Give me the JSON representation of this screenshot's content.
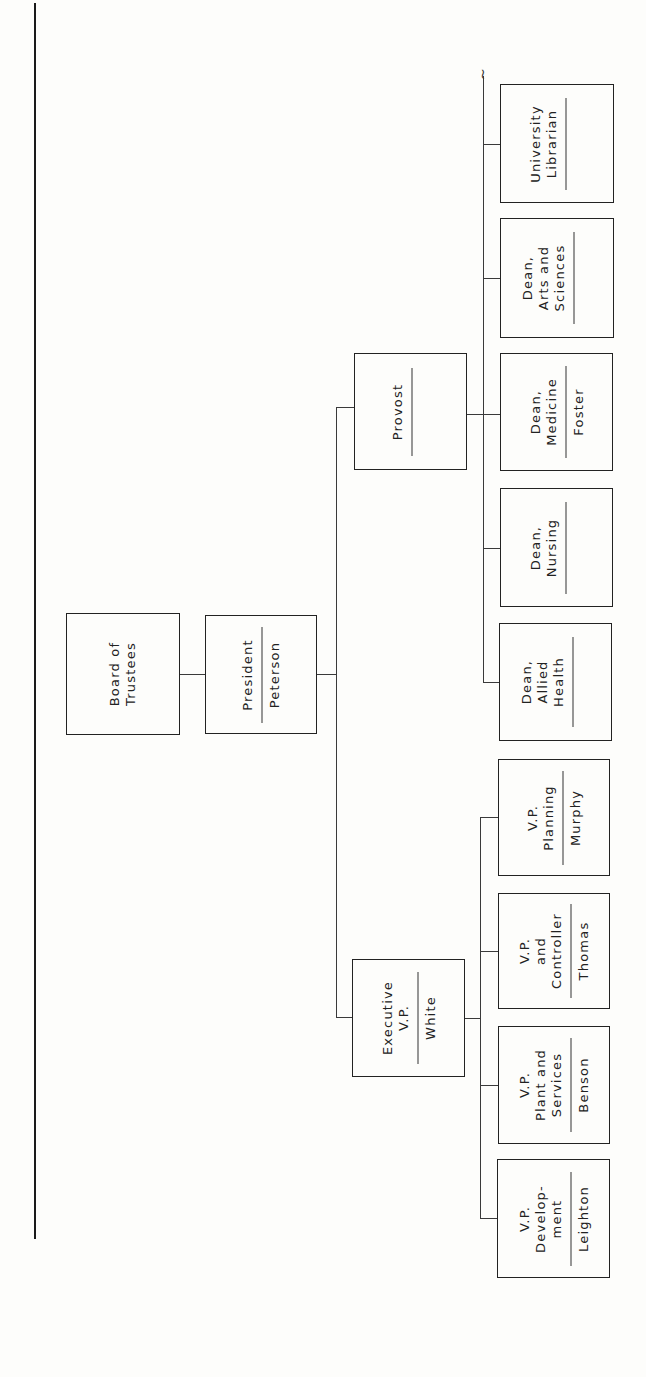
{
  "chart": {
    "orientation": "rotated-90-counterclockwise",
    "root": {
      "title": "Board of Trustees",
      "name": ""
    },
    "president": {
      "title": "President",
      "name": "Peterson"
    },
    "provost": {
      "title": "Provost",
      "name": ""
    },
    "executive_vp": {
      "title": "Executive\nV.P.",
      "name": "White"
    },
    "provost_reports": [
      {
        "title": "University\nLibrarian",
        "name": ""
      },
      {
        "title": "Dean,\nArts and\nSciences",
        "name": ""
      },
      {
        "title": "Dean,\nMedicine",
        "name": "Foster"
      },
      {
        "title": "Dean,\nNursing",
        "name": ""
      },
      {
        "title": "Dean,\nAllied\nHealth",
        "name": ""
      }
    ],
    "executive_vp_reports": [
      {
        "title": "V.P.\nPlanning",
        "name": "Murphy"
      },
      {
        "title": "V.P.\nand\nController",
        "name": "Thomas"
      },
      {
        "title": "V.P.\nPlant and\nServices",
        "name": "Benson"
      },
      {
        "title": "V.P.\nDevelop-\nment",
        "name": "Leighton"
      }
    ],
    "continuation_mark": "~"
  }
}
